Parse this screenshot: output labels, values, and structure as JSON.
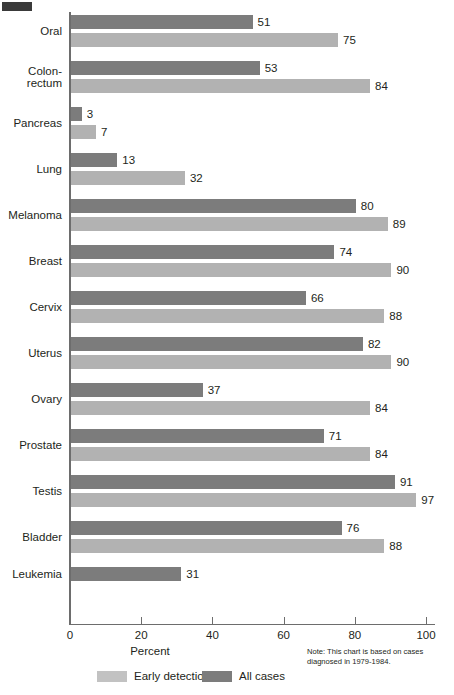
{
  "chart_data": {
    "type": "bar",
    "orientation": "horizontal",
    "title": "",
    "xlabel": "Percent",
    "ylabel": "",
    "xlim": [
      0,
      100
    ],
    "xticks": [
      0,
      20,
      40,
      60,
      80,
      100
    ],
    "xtick_labels": [
      "0",
      "20",
      "40",
      "60",
      "80",
      "100"
    ],
    "grid": false,
    "legend_position": "bottom-left",
    "note": "Note:  This chart is based on cases diagnosed in 1979-1984.",
    "categories": [
      "Oral",
      "Colon-\nrectum",
      "Pancreas",
      "Lung",
      "Melanoma",
      "Breast",
      "Cervix",
      "Uterus",
      "Ovary",
      "Prostate",
      "Testis",
      "Bladder",
      "Leukemia"
    ],
    "series": [
      {
        "name": "All cases",
        "color": "#7c7c7c",
        "values": [
          51,
          53,
          3,
          13,
          80,
          74,
          66,
          82,
          37,
          71,
          91,
          76,
          31
        ]
      },
      {
        "name": "Early detection",
        "color": "#b2b2b2",
        "values": [
          75,
          84,
          7,
          32,
          89,
          90,
          88,
          90,
          84,
          84,
          97,
          88,
          null
        ]
      }
    ]
  },
  "legend": {
    "items": [
      {
        "label": "Early detection",
        "swatch": "early-det"
      },
      {
        "label": "All cases",
        "swatch": "all-cases"
      }
    ]
  },
  "axis": {
    "x_title": "Percent"
  },
  "note_text": "Note:  This chart is based on cases diagnosed in 1979-1984."
}
